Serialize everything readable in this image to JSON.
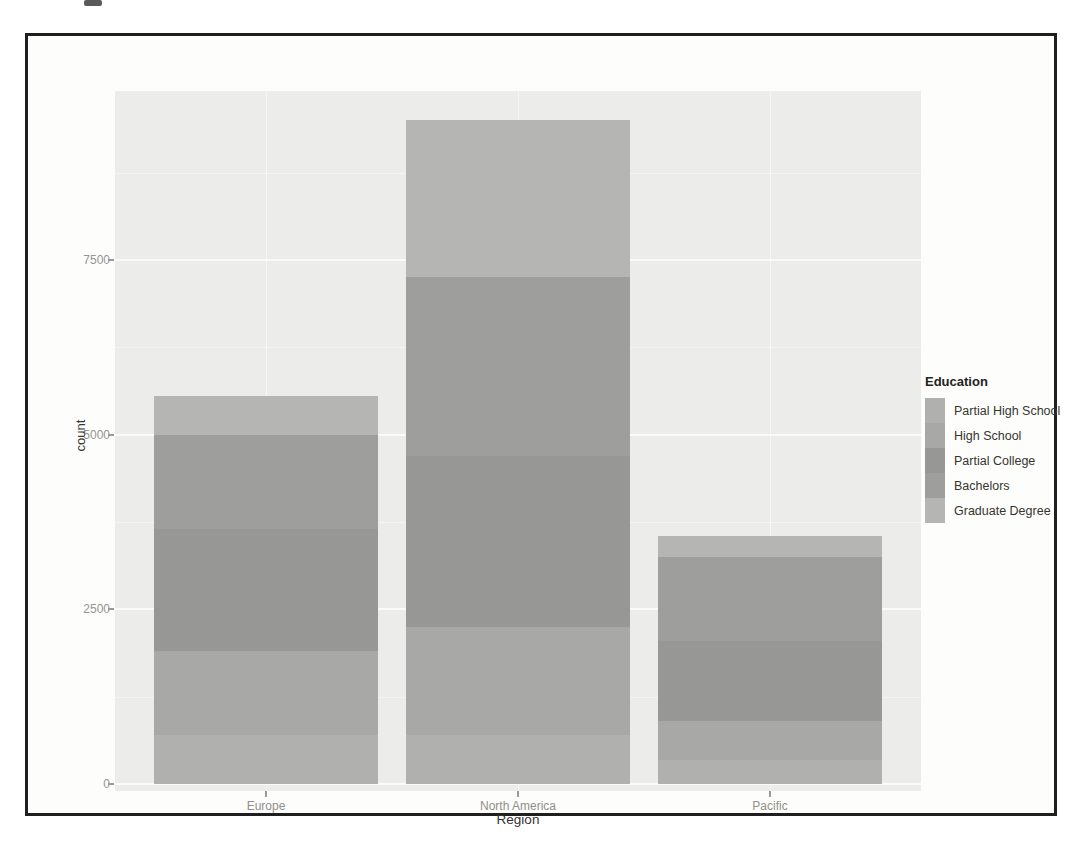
{
  "chart_data": {
    "type": "bar",
    "stacked": true,
    "stack_order": "first-series-at-bottom",
    "xlabel": "Region",
    "ylabel": "count",
    "categories": [
      "Europe",
      "North America",
      "Pacific"
    ],
    "series": [
      {
        "name": "Partial High School",
        "values": [
          700,
          700,
          350
        ],
        "color": "#b0b0ae"
      },
      {
        "name": "High School",
        "values": [
          1200,
          1550,
          550
        ],
        "color": "#a8a8a6"
      },
      {
        "name": "Partial College",
        "values": [
          1750,
          2450,
          1150
        ],
        "color": "#979795"
      },
      {
        "name": "Bachelors",
        "values": [
          1350,
          2550,
          1200
        ],
        "color": "#9e9e9c"
      },
      {
        "name": "Graduate Degree",
        "values": [
          550,
          2250,
          300
        ],
        "color": "#b5b5b3"
      }
    ],
    "totals": [
      5550,
      9500,
      3550
    ],
    "y_ticks": [
      0,
      2500,
      5000,
      7500
    ],
    "y_minor_ticks": [
      1250,
      3750,
      6250,
      8750
    ],
    "ylim": [
      0,
      9900
    ],
    "legend": {
      "title": "Education",
      "position": "right"
    },
    "panel_background": "#ececea",
    "gridline_color": "#ffffff",
    "grid": true
  }
}
